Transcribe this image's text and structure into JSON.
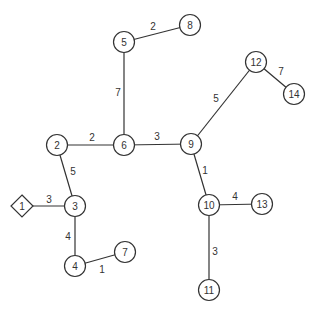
{
  "graph": {
    "type": "weighted-tree",
    "colors": {
      "stroke": "#333333",
      "fill": "#ffffff",
      "text": "#333333"
    },
    "nodes": [
      {
        "id": "1",
        "label": "1",
        "shape": "diamond",
        "x": 22,
        "y": 206
      },
      {
        "id": "2",
        "label": "2",
        "shape": "circle",
        "x": 57,
        "y": 145
      },
      {
        "id": "3",
        "label": "3",
        "shape": "circle",
        "x": 75,
        "y": 206
      },
      {
        "id": "4",
        "label": "4",
        "shape": "circle",
        "x": 75,
        "y": 266
      },
      {
        "id": "5",
        "label": "5",
        "shape": "circle",
        "x": 124,
        "y": 42
      },
      {
        "id": "6",
        "label": "6",
        "shape": "circle",
        "x": 124,
        "y": 145
      },
      {
        "id": "7",
        "label": "7",
        "shape": "circle",
        "x": 125,
        "y": 252
      },
      {
        "id": "8",
        "label": "8",
        "shape": "circle",
        "x": 190,
        "y": 25
      },
      {
        "id": "9",
        "label": "9",
        "shape": "circle",
        "x": 191,
        "y": 144
      },
      {
        "id": "10",
        "label": "10",
        "shape": "circle",
        "x": 209,
        "y": 205
      },
      {
        "id": "11",
        "label": "11",
        "shape": "circle",
        "x": 209,
        "y": 290
      },
      {
        "id": "12",
        "label": "12",
        "shape": "circle",
        "x": 256,
        "y": 62
      },
      {
        "id": "13",
        "label": "13",
        "shape": "circle",
        "x": 262,
        "y": 204
      },
      {
        "id": "14",
        "label": "14",
        "shape": "circle",
        "x": 294,
        "y": 94
      }
    ],
    "edges": [
      {
        "from": "1",
        "to": "3",
        "weight": "3",
        "lx": 49,
        "ly": 199
      },
      {
        "from": "2",
        "to": "3",
        "weight": "5",
        "lx": 73,
        "ly": 171
      },
      {
        "from": "3",
        "to": "4",
        "weight": "4",
        "lx": 68,
        "ly": 236
      },
      {
        "from": "4",
        "to": "7",
        "weight": "1",
        "lx": 102,
        "ly": 269
      },
      {
        "from": "2",
        "to": "6",
        "weight": "2",
        "lx": 92,
        "ly": 137
      },
      {
        "from": "5",
        "to": "6",
        "weight": "7",
        "lx": 118,
        "ly": 92
      },
      {
        "from": "5",
        "to": "8",
        "weight": "2",
        "lx": 153,
        "ly": 26
      },
      {
        "from": "6",
        "to": "9",
        "weight": "3",
        "lx": 157,
        "ly": 136
      },
      {
        "from": "9",
        "to": "12",
        "weight": "5",
        "lx": 216,
        "ly": 98
      },
      {
        "from": "12",
        "to": "14",
        "weight": "7",
        "lx": 281,
        "ly": 71
      },
      {
        "from": "9",
        "to": "10",
        "weight": "1",
        "lx": 205,
        "ly": 170
      },
      {
        "from": "10",
        "to": "13",
        "weight": "4",
        "lx": 235,
        "ly": 196
      },
      {
        "from": "10",
        "to": "11",
        "weight": "3",
        "lx": 215,
        "ly": 251
      }
    ]
  }
}
